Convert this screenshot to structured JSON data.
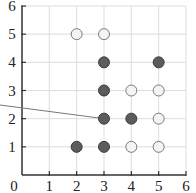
{
  "chart_data": {
    "type": "scatter",
    "title": "",
    "xlabel": "",
    "ylabel": "",
    "xlim": [
      0,
      6
    ],
    "ylim": [
      0,
      6
    ],
    "grid": true,
    "x_ticks": [
      "0",
      "1",
      "2",
      "3",
      "4",
      "5",
      "6"
    ],
    "y_ticks": [
      "0",
      "1",
      "2",
      "3",
      "4",
      "5",
      "6"
    ],
    "series": [
      {
        "name": "filled",
        "style": "filled-dark",
        "color": "#5c5c5c",
        "points": [
          [
            3,
            4
          ],
          [
            5,
            4
          ],
          [
            3,
            3
          ],
          [
            3,
            2
          ],
          [
            4,
            2
          ],
          [
            2,
            1
          ],
          [
            3,
            1
          ]
        ]
      },
      {
        "name": "hollow",
        "style": "hollow-light",
        "color": "#f2f2f2",
        "points": [
          [
            2,
            5
          ],
          [
            3,
            5
          ],
          [
            4,
            3
          ],
          [
            5,
            3
          ],
          [
            5,
            2
          ],
          [
            4,
            1
          ],
          [
            5,
            1
          ]
        ]
      }
    ],
    "annotations": [
      {
        "type": "pointer-line",
        "from_left_edge": true,
        "to_point": [
          3,
          2
        ]
      }
    ]
  },
  "colors": {
    "axis": "#333333",
    "grid": "#dddddd",
    "filled_fill": "#5c5c5c",
    "filled_stroke": "#3a3a3a",
    "hollow_fill": "#f4f4f4",
    "hollow_stroke": "#7a7a7a",
    "pointer": "#777777"
  }
}
